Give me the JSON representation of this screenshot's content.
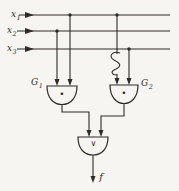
{
  "inputs": [
    {
      "base": "x",
      "sub": "1"
    },
    {
      "base": "x",
      "sub": "2"
    },
    {
      "base": "x",
      "sub": "3"
    }
  ],
  "gates": {
    "g1": {
      "base": "G",
      "sub": "1",
      "symbol": "•"
    },
    "g2": {
      "base": "G",
      "sub": "2",
      "symbol": "•"
    },
    "or": {
      "symbol": "∨"
    }
  },
  "output": {
    "label": "f"
  },
  "colors": {
    "line": "#2e2b28",
    "background": "#f7f5f1"
  }
}
